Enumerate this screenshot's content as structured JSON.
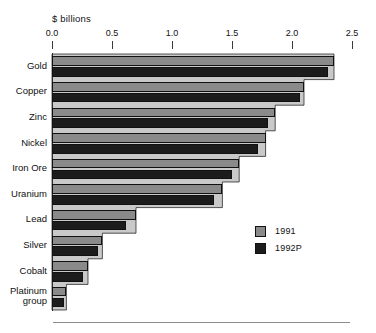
{
  "chart_data": {
    "type": "bar",
    "orientation": "horizontal",
    "title": "",
    "subtitle": "",
    "xlabel": "$ billions",
    "ylabel": "",
    "xlim": [
      0.0,
      2.5
    ],
    "xticks": [
      "0.0",
      "0.5",
      "1.0",
      "1.5",
      "2.0",
      "2.5"
    ],
    "xtick_values": [
      0.0,
      0.5,
      1.0,
      1.5,
      2.0,
      2.5
    ],
    "grid": false,
    "legend_position": "center-right",
    "categories": [
      "Gold",
      "Copper",
      "Zinc",
      "Nickel",
      "Iron Ore",
      "Uranium",
      "Lead",
      "Silver",
      "Cobalt",
      "Platinum\ngroup"
    ],
    "series": [
      {
        "name": "1991",
        "color": "#8a8a8a",
        "values": [
          2.35,
          2.1,
          1.86,
          1.78,
          1.56,
          1.42,
          0.7,
          0.42,
          0.3,
          0.12
        ]
      },
      {
        "name": "1992P",
        "color": "#1c1c1c",
        "values": [
          2.3,
          2.07,
          1.8,
          1.72,
          1.5,
          1.35,
          0.62,
          0.38,
          0.26,
          0.1
        ]
      }
    ],
    "area_fill_color": "#c9c9c9",
    "annotations": []
  },
  "axis": {
    "unit_label": "$ billions"
  },
  "legend": {
    "entries": [
      {
        "label": "1991"
      },
      {
        "label": "1992P"
      }
    ]
  },
  "colors": {
    "series_1991": "#8a8a8a",
    "series_1992p": "#1c1c1c",
    "area_fill": "#c9c9c9",
    "axis": "#2c2c2c",
    "text": "#111111",
    "rule": "#8d8d8d",
    "background": "#ffffff"
  }
}
